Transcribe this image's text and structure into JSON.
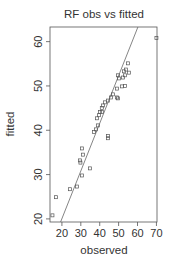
{
  "chart_data": {
    "type": "scatter",
    "title": "RF obs vs fitted",
    "xlabel": "observed",
    "ylabel": "fitted",
    "xlim": [
      13.7,
      70.3
    ],
    "ylim": [
      19.3,
      63.3
    ],
    "x_ticks": [
      20,
      30,
      40,
      50,
      60,
      70
    ],
    "y_ticks": [
      20,
      30,
      40,
      50,
      60
    ],
    "grid": false,
    "legend": null,
    "point_marker": "open-square",
    "points": [
      {
        "x": 15.0,
        "y": 20.8
      },
      {
        "x": 16.8,
        "y": 24.9
      },
      {
        "x": 24.2,
        "y": 26.7
      },
      {
        "x": 27.9,
        "y": 27.3
      },
      {
        "x": 30.6,
        "y": 29.8
      },
      {
        "x": 34.8,
        "y": 31.4
      },
      {
        "x": 29.5,
        "y": 33.2
      },
      {
        "x": 29.8,
        "y": 32.7
      },
      {
        "x": 31.2,
        "y": 34.5
      },
      {
        "x": 30.6,
        "y": 35.9
      },
      {
        "x": 36.9,
        "y": 39.6
      },
      {
        "x": 44.3,
        "y": 38.7
      },
      {
        "x": 44.3,
        "y": 38.2
      },
      {
        "x": 38.0,
        "y": 40.2
      },
      {
        "x": 39.0,
        "y": 41.1
      },
      {
        "x": 38.5,
        "y": 42.7
      },
      {
        "x": 39.6,
        "y": 43.4
      },
      {
        "x": 40.1,
        "y": 44.1
      },
      {
        "x": 41.1,
        "y": 44.1
      },
      {
        "x": 41.1,
        "y": 45.0
      },
      {
        "x": 41.7,
        "y": 45.6
      },
      {
        "x": 42.8,
        "y": 46.3
      },
      {
        "x": 44.3,
        "y": 46.7
      },
      {
        "x": 45.9,
        "y": 47.4
      },
      {
        "x": 47.0,
        "y": 48.1
      },
      {
        "x": 49.1,
        "y": 47.4
      },
      {
        "x": 49.6,
        "y": 47.2
      },
      {
        "x": 49.1,
        "y": 49.4
      },
      {
        "x": 51.7,
        "y": 49.9
      },
      {
        "x": 53.3,
        "y": 50.0
      },
      {
        "x": 50.2,
        "y": 51.7
      },
      {
        "x": 49.6,
        "y": 52.4
      },
      {
        "x": 52.3,
        "y": 51.9
      },
      {
        "x": 53.3,
        "y": 52.4
      },
      {
        "x": 52.8,
        "y": 53.3
      },
      {
        "x": 55.4,
        "y": 53.0
      },
      {
        "x": 53.9,
        "y": 53.7
      },
      {
        "x": 54.9,
        "y": 55.1
      },
      {
        "x": 70.0,
        "y": 60.8
      }
    ],
    "fit_line": {
      "x1": 19.3,
      "y1": 19.3,
      "x2": 60.2,
      "y2": 63.3
    }
  }
}
